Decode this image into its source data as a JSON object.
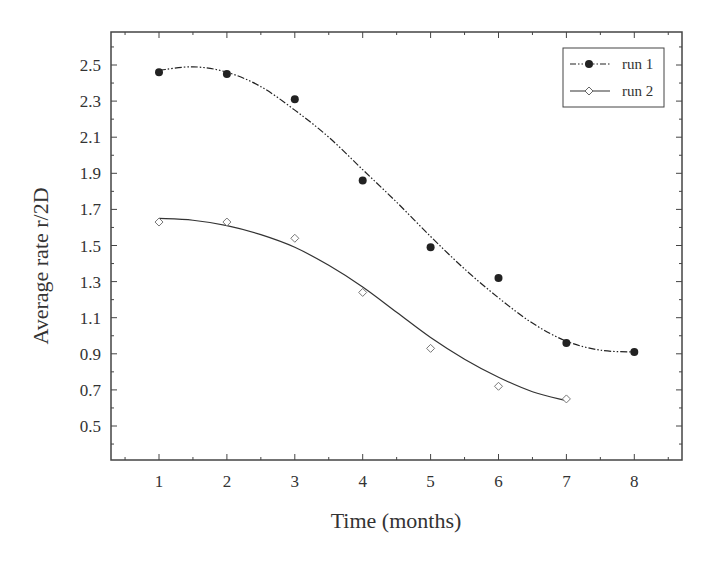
{
  "chart_data": {
    "type": "scatter",
    "title": "",
    "xlabel": "Time (months)",
    "ylabel": "Average rate r/2D",
    "xlim": [
      0.3,
      8.7
    ],
    "ylim": [
      0.31,
      2.69
    ],
    "x_ticks": [
      1,
      2,
      3,
      4,
      5,
      6,
      7,
      8
    ],
    "y_ticks": [
      0.5,
      0.7,
      0.9,
      1.1,
      1.3,
      1.5,
      1.7,
      1.9,
      2.1,
      2.3,
      2.5
    ],
    "y_tick_labels": [
      "0.5",
      "0.7",
      "0.9",
      "1.1",
      "1.3",
      "1.5",
      "1.7",
      "1.9",
      "2.1",
      "2.3",
      "2.5"
    ],
    "grid": false,
    "legend_position": "upper right",
    "series": [
      {
        "name": "run 1",
        "marker": "filled-circle",
        "line_style": "dash-dot-dot",
        "color": "#222222",
        "x": [
          1,
          2,
          3,
          4,
          5,
          6,
          7,
          8
        ],
        "values": [
          2.46,
          2.45,
          2.31,
          1.86,
          1.49,
          1.32,
          0.96,
          0.91
        ],
        "fit_curve": [
          [
            1,
            2.47
          ],
          [
            1.5,
            2.49
          ],
          [
            2,
            2.46
          ],
          [
            2.5,
            2.38
          ],
          [
            3,
            2.25
          ],
          [
            3.5,
            2.1
          ],
          [
            4,
            1.92
          ],
          [
            4.5,
            1.74
          ],
          [
            5,
            1.55
          ],
          [
            5.5,
            1.37
          ],
          [
            6,
            1.21
          ],
          [
            6.5,
            1.07
          ],
          [
            7,
            0.97
          ],
          [
            7.5,
            0.92
          ],
          [
            8,
            0.91
          ]
        ]
      },
      {
        "name": "run 2",
        "marker": "open-diamond",
        "line_style": "solid",
        "color": "#333333",
        "x": [
          1,
          2,
          3,
          4,
          5,
          6,
          7
        ],
        "values": [
          1.63,
          1.63,
          1.54,
          1.24,
          0.93,
          0.72,
          0.65
        ],
        "fit_curve": [
          [
            1,
            1.65
          ],
          [
            1.5,
            1.64
          ],
          [
            2,
            1.61
          ],
          [
            2.5,
            1.56
          ],
          [
            3,
            1.49
          ],
          [
            3.5,
            1.39
          ],
          [
            4,
            1.27
          ],
          [
            4.5,
            1.13
          ],
          [
            5,
            0.99
          ],
          [
            5.5,
            0.87
          ],
          [
            6,
            0.77
          ],
          [
            6.5,
            0.69
          ],
          [
            7,
            0.64
          ]
        ]
      }
    ]
  }
}
